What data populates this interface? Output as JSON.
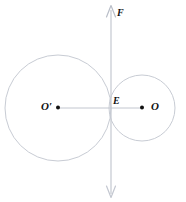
{
  "figure": {
    "kind": "geometry-diagram",
    "width": 186,
    "height": 202,
    "background_color": "#ffffff",
    "stroke_color": "#c8ccd4",
    "line_color": "#c2c6cf",
    "dot_color": "#111111",
    "label_color": "#111111",
    "labels": {
      "large_circle_center": "O′",
      "tangency_point": "E",
      "small_circle_center": "O",
      "force_vector": "F"
    },
    "circles": [
      {
        "name": "large-circle",
        "center_label": "O′",
        "cx": 58,
        "cy": 108,
        "r": 53
      },
      {
        "name": "small-circle",
        "center_label": "O",
        "cx": 142,
        "cy": 108,
        "r": 33
      }
    ],
    "points": [
      {
        "name": "O-prime",
        "label": "O′",
        "x": 58,
        "y": 108
      },
      {
        "name": "E",
        "label": "E",
        "x": 111,
        "y": 108
      },
      {
        "name": "O",
        "label": "O",
        "x": 142,
        "y": 108
      }
    ],
    "segments": [
      {
        "name": "center-line",
        "x1": 58,
        "y1": 108,
        "x2": 142,
        "y2": 108
      }
    ],
    "vectors": [
      {
        "name": "F",
        "label": "F",
        "x": 111,
        "y_top": 5,
        "y_bottom": 198,
        "double_headed": true
      }
    ]
  }
}
